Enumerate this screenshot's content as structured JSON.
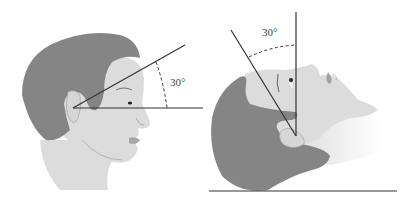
{
  "figure": {
    "left_panel": {
      "description": "Head upright in profile, reference line tilted up from horizontal",
      "angle_label": "30°"
    },
    "right_panel": {
      "description": "Head tilted back lying supine, line tilted from vertical",
      "angle_label": "30°"
    },
    "colors": {
      "hair": "#858585",
      "skin": "#dcdcdc",
      "line": "#333333",
      "background": "#ffffff"
    }
  }
}
